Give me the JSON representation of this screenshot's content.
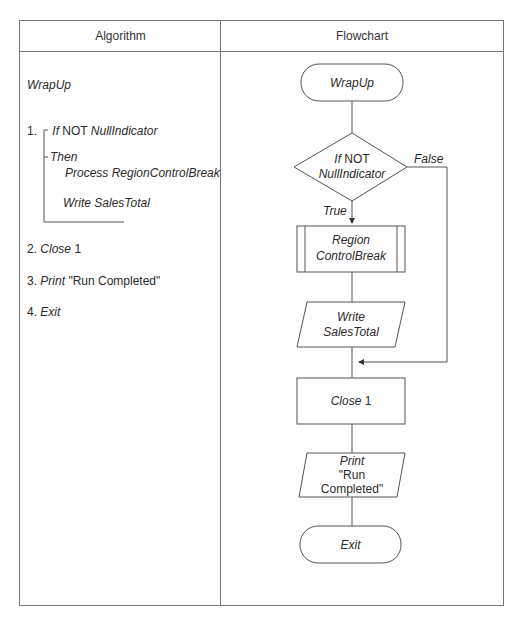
{
  "table": {
    "headers": {
      "algorithm": "Algorithm",
      "flowchart": "Flowchart"
    }
  },
  "algorithm": {
    "title": "WrapUp",
    "steps": [
      {
        "num": "1.",
        "keyword": "If",
        "rest_plain": " NOT ",
        "rest_italic": "NullIndicator"
      },
      {
        "then": "Then",
        "line1": "Process RegionControlBreak",
        "line2": "Write SalesTotal"
      },
      {
        "num": "2.",
        "keyword": "Close",
        "rest_plain": " 1"
      },
      {
        "num": "3.",
        "keyword": "Print",
        "rest_plain": " \"Run Completed\""
      },
      {
        "num": "4.",
        "keyword": "Exit"
      }
    ]
  },
  "flowchart": {
    "start": "WrapUp",
    "decision": {
      "line1_italic": "If",
      "line1_plain": " NOT",
      "line2": "NullIndicator"
    },
    "true_label": "True",
    "false_label": "False",
    "process": {
      "line1": "Region",
      "line2": "ControlBreak"
    },
    "write": {
      "line1": "Write",
      "line2": "SalesTotal"
    },
    "close": {
      "italic": "Close",
      "plain": " 1"
    },
    "print": {
      "line1": "Print",
      "line2": "\"Run",
      "line3": "Completed\""
    },
    "end": "Exit"
  },
  "colors": {
    "line": "#555555",
    "border": "#777777",
    "text": "#2a2a2a"
  }
}
